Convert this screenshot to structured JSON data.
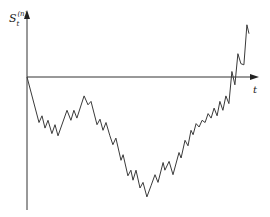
{
  "chart_data": {
    "type": "line",
    "title": "",
    "xlabel": "t",
    "ylabel": "S_t^(n)",
    "ylabel_main": "S",
    "ylabel_sub": "t",
    "ylabel_sup": "(n)",
    "grid": false,
    "legend": "none",
    "xlim": [
      0,
      1
    ],
    "ylim": [
      -1.0,
      0.5
    ],
    "series": [
      {
        "name": "random walk path",
        "x": [
          0.0,
          0.052,
          0.065,
          0.078,
          0.091,
          0.108,
          0.121,
          0.134,
          0.173,
          0.19,
          0.203,
          0.216,
          0.247,
          0.264,
          0.277,
          0.303,
          0.316,
          0.329,
          0.342,
          0.359,
          0.372,
          0.385,
          0.407,
          0.416,
          0.437,
          0.45,
          0.459,
          0.472,
          0.489,
          0.502,
          0.519,
          0.537,
          0.554,
          0.567,
          0.589,
          0.597,
          0.615,
          0.632,
          0.658,
          0.667,
          0.684,
          0.697,
          0.71,
          0.719,
          0.732,
          0.745,
          0.758,
          0.771,
          0.784,
          0.797,
          0.81,
          0.823,
          0.835,
          0.848,
          0.861,
          0.874,
          0.887,
          0.9,
          0.913,
          0.926,
          0.939,
          0.952,
          0.961
        ],
        "y": [
          0.0,
          -0.41,
          -0.35,
          -0.46,
          -0.39,
          -0.51,
          -0.43,
          -0.53,
          -0.3,
          -0.39,
          -0.3,
          -0.37,
          -0.17,
          -0.25,
          -0.22,
          -0.43,
          -0.38,
          -0.48,
          -0.41,
          -0.53,
          -0.61,
          -0.55,
          -0.75,
          -0.7,
          -0.89,
          -0.84,
          -0.93,
          -0.84,
          -1.0,
          -0.95,
          -1.08,
          -0.98,
          -0.88,
          -0.95,
          -0.77,
          -0.84,
          -0.76,
          -0.88,
          -0.68,
          -0.73,
          -0.57,
          -0.62,
          -0.48,
          -0.52,
          -0.42,
          -0.45,
          -0.39,
          -0.41,
          -0.33,
          -0.37,
          -0.28,
          -0.35,
          -0.22,
          -0.3,
          -0.17,
          -0.24,
          0.05,
          -0.07,
          0.21,
          0.12,
          0.11,
          0.47,
          0.39
        ]
      }
    ]
  }
}
